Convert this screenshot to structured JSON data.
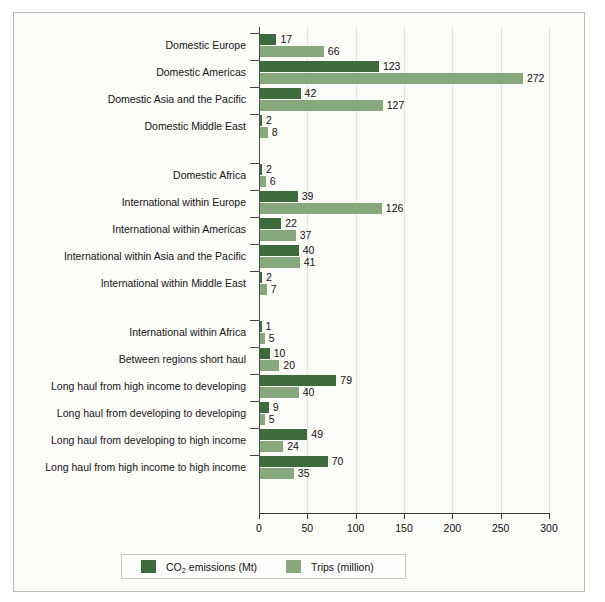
{
  "chart_data": {
    "type": "bar",
    "orientation": "horizontal",
    "title": "",
    "subtitle": "",
    "xlabel": "",
    "ylabel": "",
    "xlim": [
      0,
      300
    ],
    "xticks": [
      0,
      50,
      100,
      150,
      200,
      250,
      300
    ],
    "xticklabels": [
      "0",
      "50",
      "100",
      "150",
      "200",
      "250",
      "300"
    ],
    "grid": true,
    "grid_axis": "x",
    "legend_position": "bottom",
    "categories": [
      "Domestic Europe",
      "Domestic Americas",
      "Domestic Asia and the Pacific",
      "Domestic Middle East",
      "Domestic Africa",
      "International within Europe",
      "International within Americas",
      "International within Asia and the Pacific",
      "International within Middle East",
      "International within Africa",
      "Between regions short haul",
      "Long haul from high income to developing",
      "Long haul from developing to developing",
      "Long haul from developing to high income",
      "Long haul from high income to high income"
    ],
    "group_breaks_after": [
      4,
      9
    ],
    "series": [
      {
        "name": "CO2 emissions (Mt)",
        "label_html": "CO<sub>2</sub> emissions (Mt)",
        "color": "#3d6b3c",
        "values": [
          17,
          123,
          42,
          2,
          2,
          39,
          22,
          40,
          2,
          1,
          10,
          79,
          9,
          49,
          70
        ]
      },
      {
        "name": "Trips (million)",
        "label_html": "Trips (million)",
        "color": "#86a87c",
        "values": [
          66,
          272,
          127,
          8,
          6,
          126,
          37,
          41,
          7,
          5,
          20,
          40,
          5,
          24,
          35
        ]
      }
    ]
  },
  "legend": {
    "entries": [
      {
        "label": "CO2 emissions (Mt)",
        "color": "#3d6b3c"
      },
      {
        "label": "Trips (million)",
        "color": "#86a87c"
      }
    ]
  },
  "colors": {
    "co2": "#3d6b3c",
    "trips": "#86a87c",
    "background": "#fbfbf8",
    "border": "#b9bbb4",
    "gridline": "#e2e4de",
    "axis": "#3a3a3a"
  }
}
